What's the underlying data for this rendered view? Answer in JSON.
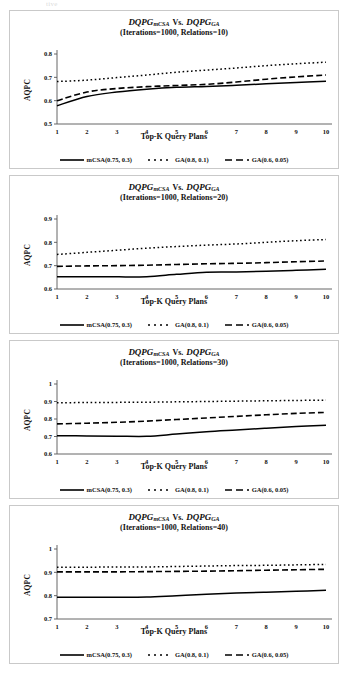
{
  "document": {
    "top_partial_text": "tive"
  },
  "legend": {
    "items": [
      {
        "label": "mCSA(0.75, 0.3)",
        "style": "solid",
        "name": "legend-mcsa"
      },
      {
        "label": "GA(0.8, 0.1)",
        "style": "dotted",
        "name": "legend-ga-08"
      },
      {
        "label": "GA(0.6, 0.05)",
        "style": "dashed",
        "name": "legend-ga-06"
      }
    ]
  },
  "chart_data": [
    {
      "type": "line",
      "title_main_prefix": "DQPG",
      "title_main_sub1": "mCSA",
      "title_vs": "Vs.",
      "title_main_sub2": "GA",
      "title_line2": "(Iterations=1000, Relations=10)",
      "xlabel": "Top-K Query Plans",
      "ylabel": "AQPC",
      "x": [
        1,
        2,
        3,
        4,
        5,
        6,
        7,
        8,
        9,
        10
      ],
      "categories": [
        "1",
        "2",
        "3",
        "4",
        "5",
        "6",
        "7",
        "8",
        "9",
        "10"
      ],
      "yticks": [
        "0.5",
        "0.6",
        "0.7",
        "0.8"
      ],
      "ylim": [
        0.5,
        0.8
      ],
      "xlim": [
        1,
        10
      ],
      "grid": false,
      "legend_position": "bottom",
      "series": [
        {
          "name": "mCSA(0.75, 0.3)",
          "style": "solid",
          "values": [
            0.578,
            0.618,
            0.637,
            0.649,
            0.657,
            0.661,
            0.666,
            0.672,
            0.678,
            0.683
          ]
        },
        {
          "name": "GA(0.8, 0.1)",
          "style": "dotted",
          "values": [
            0.682,
            0.688,
            0.699,
            0.71,
            0.722,
            0.731,
            0.74,
            0.75,
            0.758,
            0.765
          ]
        },
        {
          "name": "GA(0.6, 0.05)",
          "style": "dashed",
          "values": [
            0.6,
            0.637,
            0.652,
            0.66,
            0.665,
            0.67,
            0.68,
            0.692,
            0.702,
            0.71
          ]
        }
      ]
    },
    {
      "type": "line",
      "title_main_prefix": "DQPG",
      "title_main_sub1": "mCSA",
      "title_vs": "Vs.",
      "title_main_sub2": "GA",
      "title_line2": "(Iterations=1000, Relations=20)",
      "xlabel": "Top-K Query Plans",
      "ylabel": "AQPC",
      "x": [
        1,
        2,
        3,
        4,
        5,
        6,
        7,
        8,
        9,
        10
      ],
      "categories": [
        "1",
        "2",
        "3",
        "4",
        "5",
        "6",
        "7",
        "8",
        "9",
        "10"
      ],
      "yticks": [
        "0.6",
        "0.7",
        "0.8",
        "0.9"
      ],
      "ylim": [
        0.6,
        0.9
      ],
      "xlim": [
        1,
        10
      ],
      "grid": false,
      "legend_position": "bottom",
      "series": [
        {
          "name": "mCSA(0.75, 0.3)",
          "style": "solid",
          "values": [
            0.652,
            0.652,
            0.652,
            0.653,
            0.663,
            0.672,
            0.673,
            0.676,
            0.68,
            0.685
          ]
        },
        {
          "name": "GA(0.8, 0.1)",
          "style": "dotted",
          "values": [
            0.748,
            0.757,
            0.766,
            0.775,
            0.782,
            0.788,
            0.793,
            0.8,
            0.807,
            0.812
          ]
        },
        {
          "name": "GA(0.6, 0.05)",
          "style": "dashed",
          "values": [
            0.697,
            0.699,
            0.7,
            0.702,
            0.705,
            0.708,
            0.71,
            0.713,
            0.717,
            0.72
          ]
        }
      ]
    },
    {
      "type": "line",
      "title_main_prefix": "DQPG",
      "title_main_sub1": "mCSA",
      "title_vs": "Vs.",
      "title_main_sub2": "GA",
      "title_line2": "(Iterations=1000, Relations=30)",
      "xlabel": "Top-K Query Plans",
      "ylabel": "AQPC",
      "x": [
        1,
        2,
        3,
        4,
        5,
        6,
        7,
        8,
        9,
        10
      ],
      "categories": [
        "1",
        "2",
        "3",
        "4",
        "5",
        "6",
        "7",
        "8",
        "9",
        "10"
      ],
      "yticks": [
        "0.6",
        "0.7",
        "0.8",
        "0.9",
        "1"
      ],
      "ylim": [
        0.6,
        1.0
      ],
      "xlim": [
        1,
        10
      ],
      "grid": false,
      "legend_position": "bottom",
      "series": [
        {
          "name": "mCSA(0.75, 0.3)",
          "style": "solid",
          "values": [
            0.705,
            0.703,
            0.702,
            0.701,
            0.714,
            0.727,
            0.737,
            0.747,
            0.757,
            0.765
          ]
        },
        {
          "name": "GA(0.8, 0.1)",
          "style": "dotted",
          "values": [
            0.893,
            0.894,
            0.895,
            0.896,
            0.898,
            0.9,
            0.902,
            0.904,
            0.906,
            0.908
          ]
        },
        {
          "name": "GA(0.6, 0.05)",
          "style": "dashed",
          "values": [
            0.772,
            0.776,
            0.781,
            0.788,
            0.797,
            0.806,
            0.815,
            0.824,
            0.832,
            0.838
          ]
        }
      ]
    },
    {
      "type": "line",
      "title_main_prefix": "DQPG",
      "title_main_sub1": "mCSA",
      "title_vs": "Vs.",
      "title_main_sub2": "GA",
      "title_line2": "(Iterations=1000, Relations=40)",
      "xlabel": "Top-K Query Plans",
      "ylabel": "AQPC",
      "x": [
        1,
        2,
        3,
        4,
        5,
        6,
        7,
        8,
        9,
        10
      ],
      "categories": [
        "1",
        "2",
        "3",
        "4",
        "5",
        "6",
        "7",
        "8",
        "9",
        "10"
      ],
      "yticks": [
        "0.7",
        "0.8",
        "0.9",
        "1"
      ],
      "ylim": [
        0.7,
        1.0
      ],
      "xlim": [
        1,
        10
      ],
      "grid": false,
      "legend_position": "bottom",
      "series": [
        {
          "name": "mCSA(0.75, 0.3)",
          "style": "solid",
          "values": [
            0.793,
            0.793,
            0.793,
            0.794,
            0.8,
            0.806,
            0.811,
            0.815,
            0.819,
            0.823
          ]
        },
        {
          "name": "GA(0.8, 0.1)",
          "style": "dotted",
          "values": [
            0.922,
            0.922,
            0.923,
            0.923,
            0.925,
            0.927,
            0.929,
            0.93,
            0.932,
            0.934
          ]
        },
        {
          "name": "GA(0.6, 0.05)",
          "style": "dashed",
          "values": [
            0.902,
            0.902,
            0.902,
            0.903,
            0.904,
            0.905,
            0.907,
            0.909,
            0.911,
            0.913
          ]
        }
      ]
    }
  ]
}
